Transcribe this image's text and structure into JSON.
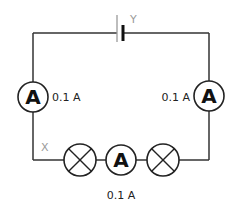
{
  "diagram": {
    "type": "series-circuit",
    "battery": {
      "label": "Y"
    },
    "points": {
      "x_label": "X"
    },
    "ammeters": [
      {
        "id": "left",
        "symbol": "A",
        "reading": "0.1 A"
      },
      {
        "id": "right",
        "symbol": "A",
        "reading": "0.1 A"
      },
      {
        "id": "bottom",
        "symbol": "A",
        "reading": "0.1 A"
      }
    ],
    "lamps": [
      {
        "id": "lamp-left"
      },
      {
        "id": "lamp-right"
      }
    ]
  }
}
